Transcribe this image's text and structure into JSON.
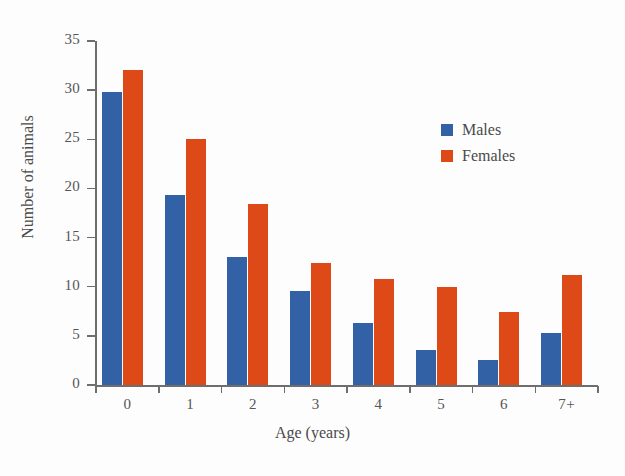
{
  "chart_data": {
    "type": "bar",
    "title": "",
    "xlabel": "Age (years)",
    "ylabel": "Number of animals",
    "categories": [
      "0",
      "1",
      "2",
      "3",
      "4",
      "5",
      "6",
      "7+"
    ],
    "series": [
      {
        "name": "Males",
        "color": "#3361a5",
        "values": [
          29.8,
          19.3,
          13.0,
          9.6,
          6.3,
          3.6,
          2.5,
          5.3
        ]
      },
      {
        "name": "Females",
        "color": "#dd4a18",
        "values": [
          32.1,
          25.0,
          18.4,
          12.4,
          10.8,
          10.0,
          7.4,
          11.2
        ]
      }
    ],
    "ylim": [
      0,
      35
    ],
    "yticks": [
      0,
      5,
      10,
      15,
      20,
      25,
      30,
      35
    ],
    "ytick_labels": [
      "0",
      "5",
      "10",
      "15",
      "20",
      "25",
      "30",
      "35"
    ],
    "grid": false,
    "legend_position": "upper right",
    "legend_entries": [
      "Males",
      "Females"
    ]
  }
}
